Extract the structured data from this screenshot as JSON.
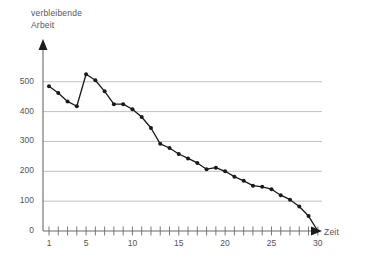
{
  "chart_data": {
    "type": "line",
    "title": "",
    "ylabel": "verbleibende Arbeit",
    "xlabel": "Zeit",
    "ylabel_lines": [
      "verbleibende",
      "Arbeit"
    ],
    "xlim": [
      0,
      31
    ],
    "ylim": [
      0,
      560
    ],
    "grid": "horizontal",
    "legend": "none",
    "y_ticks": [
      0,
      100,
      200,
      300,
      400,
      500
    ],
    "y_tick_labels": [
      "0",
      "100",
      "200",
      "300",
      "400",
      "500"
    ],
    "x_ticks": [
      1,
      2,
      3,
      4,
      5,
      6,
      7,
      8,
      9,
      10,
      11,
      12,
      13,
      14,
      15,
      16,
      17,
      18,
      19,
      20,
      21,
      22,
      23,
      24,
      25,
      26,
      27,
      28,
      29,
      30
    ],
    "x_tick_labels_shown": [
      "1",
      "5",
      "10",
      "15",
      "20",
      "25",
      "30"
    ],
    "x_tick_labels_shown_at": [
      1,
      5,
      10,
      15,
      20,
      25,
      30
    ],
    "marker": "filled-circle",
    "line_color": "#1a1a1a",
    "marker_color": "#1a1a1a",
    "grid_color": "#b9b9b9",
    "axis_color": "#6b6b6b",
    "x": [
      1,
      2,
      3,
      4,
      5,
      6,
      7,
      8,
      9,
      10,
      11,
      12,
      13,
      14,
      15,
      16,
      17,
      18,
      19,
      20,
      21,
      22,
      23,
      24,
      25,
      26,
      27,
      28,
      29,
      30
    ],
    "values": [
      485,
      462,
      434,
      418,
      525,
      505,
      468,
      425,
      425,
      408,
      382,
      345,
      292,
      278,
      258,
      243,
      228,
      207,
      212,
      200,
      182,
      168,
      152,
      148,
      140,
      120,
      105,
      82,
      50,
      0
    ]
  }
}
